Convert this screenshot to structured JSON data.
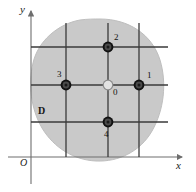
{
  "figure": {
    "background_color": "#ffffff",
    "region": {
      "name": "D",
      "label": "D",
      "label_x": 38,
      "label_y": 107,
      "fill_color": "#c9c9c9",
      "outline_color": "#bdbdbd"
    },
    "axes": {
      "x_label": "x",
      "y_label": "y",
      "origin_label": "O",
      "x_label_x": 178,
      "x_label_y": 163,
      "y_label_x": 20,
      "y_label_y": 6,
      "origin_label_x": 21,
      "origin_label_y": 160,
      "axis_color": "#6e6e6e",
      "x_axis_y": 157,
      "y_axis_x": 31,
      "x_axis_end": 186,
      "y_axis_top": 8
    },
    "grid": {
      "line_color": "#3a3a3a",
      "vertical_x": [
        66,
        108,
        139
      ],
      "vertical_top": 23,
      "vertical_bottom": 157,
      "horizontal_y": [
        47,
        85,
        122
      ],
      "horizontal_left": 31,
      "horizontal_right": 168
    },
    "nodes": [
      {
        "id": "0",
        "label": "0",
        "x": 108,
        "y": 85,
        "radius": 5,
        "fill_color": "#dcdcdc",
        "ring_color": "#333333",
        "kind": "center-node",
        "label_x": 113,
        "label_y": 91
      },
      {
        "id": "1",
        "label": "1",
        "x": 139,
        "y": 85,
        "radius": 5,
        "fill_color": "#3b3b3b",
        "ring_color": "#111111",
        "kind": "neighbor-node",
        "label_x": 147,
        "label_y": 74
      },
      {
        "id": "2",
        "label": "2",
        "x": 108,
        "y": 47,
        "radius": 5,
        "fill_color": "#3b3b3b",
        "ring_color": "#111111",
        "kind": "neighbor-node",
        "label_x": 115,
        "label_y": 36
      },
      {
        "id": "3",
        "label": "3",
        "x": 66,
        "y": 85,
        "radius": 5,
        "fill_color": "#3b3b3b",
        "ring_color": "#111111",
        "kind": "neighbor-node",
        "label_x": 58,
        "label_y": 72
      },
      {
        "id": "4",
        "label": "4",
        "x": 108,
        "y": 122,
        "radius": 5,
        "fill_color": "#3b3b3b",
        "ring_color": "#111111",
        "kind": "neighbor-node",
        "label_x": 104,
        "label_y": 132
      }
    ]
  }
}
